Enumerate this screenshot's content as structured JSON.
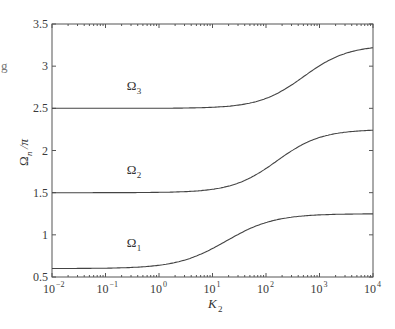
{
  "chart_data": {
    "type": "line",
    "title": "",
    "xlabel": "K",
    "xlabel_sub": "2",
    "ylabel": "Ω",
    "ylabel_sub": "n",
    "ylabel_suffix": "/π",
    "xscale": "log",
    "xlim": [
      0.01,
      10000
    ],
    "ylim": [
      0.5,
      3.5
    ],
    "grid": false,
    "legend": "none (inline labels)",
    "x_ticks": [
      {
        "base": "10",
        "exp": "−2"
      },
      {
        "base": "10",
        "exp": "−1"
      },
      {
        "base": "10",
        "exp": "0"
      },
      {
        "base": "10",
        "exp": "1"
      },
      {
        "base": "10",
        "exp": "2"
      },
      {
        "base": "10",
        "exp": "3"
      },
      {
        "base": "10",
        "exp": "4"
      }
    ],
    "y_ticks": [
      "0.5",
      "1",
      "1.5",
      "2",
      "2.5",
      "3",
      "3.5"
    ],
    "series": [
      {
        "name": "Ω1",
        "label_base": "Ω",
        "label_sub": "1",
        "low": 0.6,
        "high": 1.25,
        "log10_midpoint": 1.25,
        "steepness": 2.2,
        "approx_points": {
          "x": [
            0.01,
            0.1,
            1,
            10,
            100,
            1000,
            10000
          ],
          "y": [
            0.6,
            0.61,
            0.66,
            0.88,
            1.15,
            1.24,
            1.25
          ]
        },
        "label_pos": {
          "x": 0.25,
          "y": 0.85
        }
      },
      {
        "name": "Ω2",
        "label_base": "Ω",
        "label_sub": "2",
        "low": 1.5,
        "high": 2.25,
        "log10_midpoint": 2.2,
        "steepness": 2.4,
        "approx_points": {
          "x": [
            0.01,
            0.1,
            1,
            10,
            100,
            1000,
            10000
          ],
          "y": [
            1.5,
            1.5,
            1.5,
            1.53,
            1.8,
            2.2,
            2.25
          ]
        },
        "label_pos": {
          "x": 0.25,
          "y": 1.72
        }
      },
      {
        "name": "Ω3",
        "label_base": "Ω",
        "label_sub": "3",
        "low": 2.5,
        "high": 3.25,
        "log10_midpoint": 2.7,
        "steepness": 2.4,
        "approx_points": {
          "x": [
            0.01,
            0.1,
            1,
            10,
            100,
            1000,
            10000
          ],
          "y": [
            2.5,
            2.5,
            2.5,
            2.51,
            2.62,
            3.1,
            3.24
          ]
        },
        "label_pos": {
          "x": 0.25,
          "y": 2.72
        }
      }
    ],
    "colors": {
      "line": "#444444",
      "axis": "#555555"
    }
  },
  "stray_mark": "g"
}
